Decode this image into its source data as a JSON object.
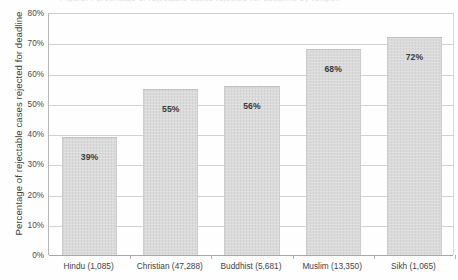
{
  "cutoff_title": "Figure: Percentage of rejectable cases rejected for deadline by religion",
  "chart_data": {
    "type": "bar",
    "title": "",
    "xlabel": "",
    "ylabel": "Percentage of rejectable cases rejected for deadline",
    "categories": [
      "Hindu (1,085)",
      "Christian (47,288)",
      "Buddhist (5,681)",
      "Muslim (13,350)",
      "Sikh (1,065)"
    ],
    "values": [
      39,
      55,
      56,
      68,
      72
    ],
    "value_labels": [
      "39%",
      "55%",
      "56%",
      "68%",
      "72%"
    ],
    "ylim": [
      0,
      80
    ],
    "ytick_values": [
      0,
      10,
      20,
      30,
      40,
      50,
      60,
      70,
      80
    ],
    "ytick_labels": [
      "0%",
      "10%",
      "20%",
      "30%",
      "40%",
      "50%",
      "60%",
      "70%",
      "80%"
    ],
    "grid": true,
    "legend": "none",
    "bar_color": "#d9d9d9",
    "gridline_color": "#d2d2d2",
    "axis_color": "#a8a8a8",
    "text_color": "#3f3f3f"
  }
}
